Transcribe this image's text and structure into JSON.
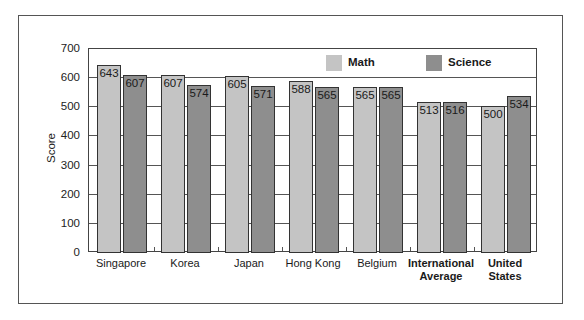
{
  "chart_data": {
    "type": "bar",
    "title": "",
    "xlabel": "",
    "ylabel": "Score",
    "ylim": [
      0,
      700
    ],
    "yticks": [
      0,
      100,
      200,
      300,
      400,
      500,
      600,
      700
    ],
    "grid": true,
    "legend_position": "top-right inside plot",
    "categories": [
      "Singapore",
      "Korea",
      "Japan",
      "Hong Kong",
      "Belgium",
      "International Average",
      "United States"
    ],
    "bold_categories": [
      "International Average",
      "United States"
    ],
    "series": [
      {
        "name": "Math",
        "color": "#c4c4c4",
        "values": [
          643,
          607,
          605,
          588,
          565,
          513,
          500
        ]
      },
      {
        "name": "Science",
        "color": "#8e8e8e",
        "values": [
          607,
          574,
          571,
          565,
          565,
          516,
          534
        ]
      }
    ]
  },
  "legend": {
    "math": "Math",
    "science": "Science"
  },
  "axis": {
    "ylabel": "Score"
  }
}
